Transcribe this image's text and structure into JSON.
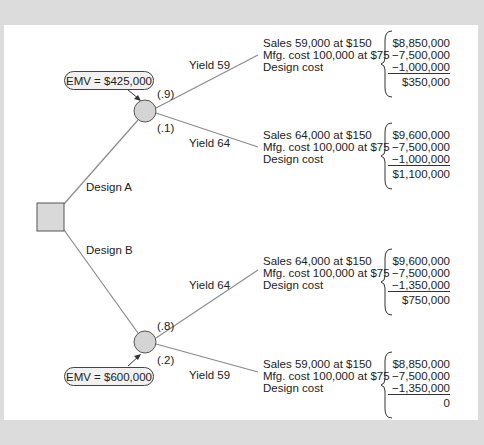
{
  "diagram": {
    "type": "decision-tree",
    "decision_node": {
      "label": "decision"
    },
    "branches": [
      {
        "label": "Design A",
        "emv": "EMV = $425,000",
        "outcomes": [
          {
            "probability": "(.9)",
            "label": "Yield 59",
            "lines": [
              "Sales 59,000 at $150",
              "Mfg. cost 100,000 at $75",
              "Design cost"
            ],
            "values": [
              "$8,850,000",
              "−7,500,000",
              "−1,000,000"
            ],
            "total": "$350,000"
          },
          {
            "probability": "(.1)",
            "label": "Yield 64",
            "lines": [
              "Sales 64,000 at $150",
              "Mfg. cost 100,000 at $75",
              "Design cost"
            ],
            "values": [
              "$9,600,000",
              "−7,500,000",
              "−1,000,000"
            ],
            "total": "$1,100,000"
          }
        ]
      },
      {
        "label": "Design B",
        "emv": "EMV = $600,000",
        "outcomes": [
          {
            "probability": "(.8)",
            "label": "Yield 64",
            "lines": [
              "Sales 64,000 at $150",
              "Mfg. cost 100,000 at $75",
              "Design cost"
            ],
            "values": [
              "$9,600,000",
              "−7,500,000",
              "−1,350,000"
            ],
            "total": "$750,000"
          },
          {
            "probability": "(.2)",
            "label": "Yield 59",
            "lines": [
              "Sales 59,000 at $150",
              "Mfg. cost 100,000 at $75",
              "Design cost"
            ],
            "values": [
              "$8,850,000",
              "−7,500,000",
              "−1,350,000"
            ],
            "total": "0"
          }
        ]
      }
    ],
    "colors": {
      "background": "#dcdcdc",
      "panel": "#ffffff",
      "node_fill": "#d4d4d4",
      "line": "#8a8a8a"
    }
  }
}
